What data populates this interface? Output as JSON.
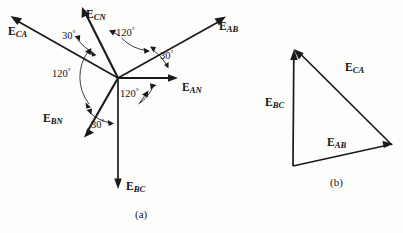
{
  "figure": {
    "background_color": "#fdfdfc",
    "line_color": "#1a1a1a",
    "captions": {
      "a": "(a)",
      "b": "(b)"
    }
  },
  "panel_a": {
    "caption": "(a)",
    "origin": {
      "x": 118,
      "y": 78
    },
    "phasors": [
      {
        "name": "E_AN",
        "symbol": "E",
        "subscript": "AN",
        "angle_deg": 0,
        "length_px": 60,
        "tip": {
          "x": 178,
          "y": 78
        },
        "label_pos": {
          "x": 182,
          "y": 82
        }
      },
      {
        "name": "E_CN",
        "symbol": "E",
        "subscript": "CN",
        "angle_deg": 120,
        "length_px": 79,
        "tip": {
          "x": 82,
          "y": 8
        },
        "label_pos": {
          "x": 86,
          "y": 9
        }
      },
      {
        "name": "E_BN",
        "symbol": "E",
        "subscript": "BN",
        "angle_deg": -120,
        "length_px": 67,
        "tip": {
          "x": 84,
          "y": 137
        },
        "label_pos": {
          "x": 43,
          "y": 119
        }
      },
      {
        "name": "E_AB",
        "symbol": "E",
        "subscript": "AB",
        "angle_deg": 30,
        "length_px": 124,
        "tip": {
          "x": 225,
          "y": 17
        },
        "label_pos": {
          "x": 220,
          "y": 26
        }
      },
      {
        "name": "E_CA",
        "symbol": "E",
        "subscript": "CA",
        "angle_deg": 150,
        "length_px": 124,
        "tip": {
          "x": 11,
          "y": 16
        },
        "label_pos": {
          "x": 8,
          "y": 29
        }
      },
      {
        "name": "E_BC",
        "symbol": "E",
        "subscript": "BC",
        "angle_deg": -90,
        "length_px": 110,
        "tip": {
          "x": 118,
          "y": 188
        },
        "label_pos": {
          "x": 126,
          "y": 184
        }
      }
    ],
    "angle_marks": [
      {
        "name": "angle-eab-ean",
        "text": "30",
        "unit": "°",
        "value_deg": 30,
        "between": [
          "E_AN",
          "E_AB"
        ],
        "label_pos": {
          "x": 160,
          "y": 53
        }
      },
      {
        "name": "angle-ecn-eca",
        "text": "30",
        "unit": "°",
        "value_deg": 30,
        "between": [
          "E_CN",
          "E_CA"
        ],
        "label_pos": {
          "x": 62,
          "y": 33
        }
      },
      {
        "name": "angle-ebn-ebc",
        "text": "30",
        "unit": "°",
        "value_deg": 30,
        "between": [
          "E_BN",
          "E_BC"
        ],
        "label_pos": {
          "x": 91,
          "y": 122
        }
      },
      {
        "name": "angle-ecn-ean",
        "text": "120",
        "unit": "°",
        "value_deg": 120,
        "between": [
          "E_AN",
          "E_CN"
        ],
        "label_pos": {
          "x": 124,
          "y": 29
        }
      },
      {
        "name": "angle-ecn-ebn",
        "text": "120",
        "unit": "°",
        "value_deg": 120,
        "between": [
          "E_CN",
          "E_BN"
        ],
        "label_pos": {
          "x": 53,
          "y": 70
        }
      },
      {
        "name": "angle-ebn-ean",
        "text": "120",
        "unit": "°",
        "value_deg": 120,
        "between": [
          "E_BN",
          "E_AN"
        ],
        "label_pos": {
          "x": 122,
          "y": 89
        }
      }
    ]
  },
  "panel_b": {
    "caption": "(b)",
    "type": "closed-phasor-triangle",
    "vertices": {
      "top_left": {
        "x": 294,
        "y": 50
      },
      "right": {
        "x": 392,
        "y": 145
      },
      "bottom_left": {
        "x": 293,
        "y": 166
      }
    },
    "phasors": [
      {
        "name": "E_AB",
        "symbol": "E",
        "subscript": "AB",
        "from": "bottom_left",
        "to": "right",
        "label_pos": {
          "x": 327,
          "y": 142
        }
      },
      {
        "name": "E_CA",
        "symbol": "E",
        "subscript": "CA",
        "from": "right",
        "to": "top_left",
        "label_pos": {
          "x": 345,
          "y": 67
        }
      },
      {
        "name": "E_BC",
        "symbol": "E",
        "subscript": "BC",
        "from": "bottom_left",
        "to": "top_left",
        "label_pos": {
          "x": 266,
          "y": 101
        }
      }
    ]
  }
}
